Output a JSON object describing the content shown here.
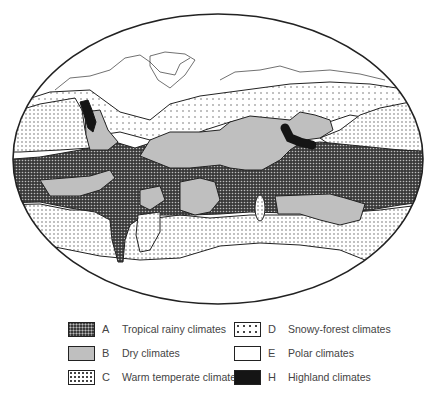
{
  "map": {
    "title": "World climate zones",
    "projection": "ellipse",
    "colors": {
      "tropical_rainy": "#3a3a3a",
      "dry": "#bfbfbf",
      "warm_temperate": "#ffffff",
      "snowy_forest": "#ffffff",
      "polar": "#ffffff",
      "highland": "#151515",
      "outline": "#222222"
    }
  },
  "legend": {
    "items": [
      {
        "code": "A",
        "label": "Tropical rainy climates",
        "pattern": "dense-dark-dots"
      },
      {
        "code": "B",
        "label": "Dry climates",
        "pattern": "solid-gray"
      },
      {
        "code": "C",
        "label": "Warm temperate climates",
        "pattern": "fine-dots"
      },
      {
        "code": "D",
        "label": "Snowy-forest climates",
        "pattern": "sparse-dots"
      },
      {
        "code": "E",
        "label": "Polar climates",
        "pattern": "white"
      },
      {
        "code": "H",
        "label": "Highland climates",
        "pattern": "solid-black"
      }
    ]
  }
}
